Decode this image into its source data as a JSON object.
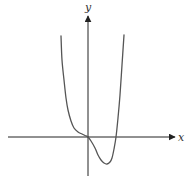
{
  "chart_data": {
    "type": "line",
    "title": "",
    "xlabel": "x",
    "ylabel": "y",
    "grid": false,
    "legend": null,
    "features": {
      "roots": [
        "origin (0)",
        "positive root (~1)"
      ],
      "inflection_at_origin": true,
      "local_minimum": {
        "x_relative": "~0.7 of positive root",
        "below_axis": true
      },
      "end_behavior": "both ends go to +infinity"
    },
    "pixel_curve": [
      [
        61,
        36
      ],
      [
        62,
        60
      ],
      [
        64,
        80
      ],
      [
        66,
        98
      ],
      [
        68,
        110
      ],
      [
        71,
        121
      ],
      [
        74,
        128
      ],
      [
        78,
        132
      ],
      [
        82,
        134
      ],
      [
        85,
        135.5
      ],
      [
        88,
        137
      ],
      [
        91,
        141
      ],
      [
        95,
        148
      ],
      [
        98,
        155
      ],
      [
        101,
        160
      ],
      [
        104,
        163
      ],
      [
        107,
        164
      ],
      [
        110,
        162
      ],
      [
        112,
        158
      ],
      [
        114,
        149
      ],
      [
        116,
        137
      ],
      [
        118,
        118
      ],
      [
        120,
        95
      ],
      [
        122,
        65
      ],
      [
        124,
        35
      ]
    ],
    "axes": {
      "origin_px": [
        88,
        137
      ],
      "x_axis_px": {
        "from": 8,
        "to": 176
      },
      "y_axis_px": {
        "from": 176,
        "to": 15
      }
    }
  },
  "labels": {
    "x": "x",
    "y": "y"
  },
  "colors": {
    "axis": "#222222",
    "curve": "#555555",
    "background": "#ffffff"
  }
}
